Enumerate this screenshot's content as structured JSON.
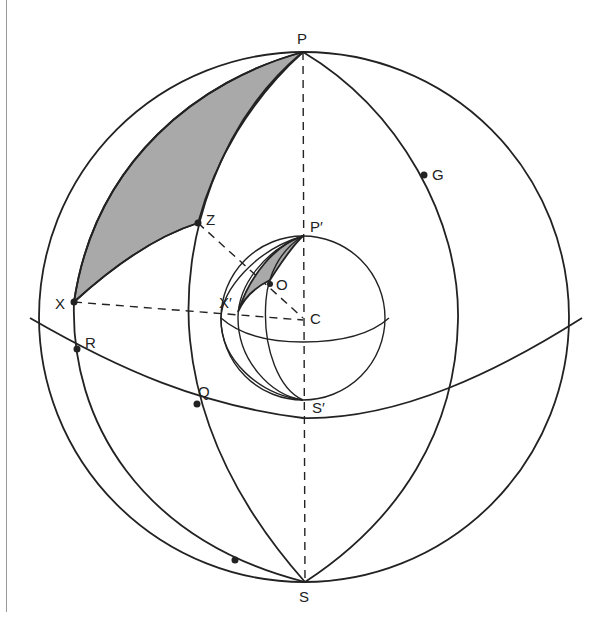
{
  "figure": {
    "labels": {
      "P": "P",
      "G": "G",
      "Z": "Z",
      "P_prime": "P′",
      "O": "O",
      "X": "X",
      "X_prime": "X′",
      "C": "C",
      "R": "R",
      "Q": "Q",
      "S_prime": "S′",
      "S": "S"
    },
    "colors": {
      "stroke": "#222222",
      "shade": "#a9a9a9",
      "margin_line": "#999999",
      "background": "#ffffff"
    }
  }
}
